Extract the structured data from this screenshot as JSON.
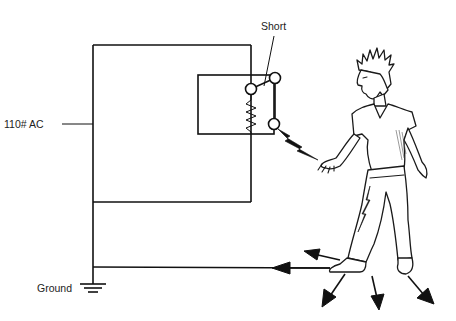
{
  "diagram": {
    "labels": {
      "source": "110# AC",
      "fault": "Short",
      "ground": "Ground"
    },
    "components": [
      {
        "id": "outer-circuit",
        "type": "loop"
      },
      {
        "id": "appliance-housing",
        "type": "box"
      },
      {
        "id": "heating-element",
        "type": "resistor"
      },
      {
        "id": "switch",
        "type": "switch",
        "state": "shorted to housing"
      },
      {
        "id": "ground-symbol",
        "type": "earth-ground"
      },
      {
        "id": "person",
        "type": "illustration",
        "pose": "touching housing"
      }
    ],
    "current_path": [
      "110# AC",
      "Short",
      "housing",
      "hand",
      "body",
      "feet",
      "Ground"
    ],
    "colors": {
      "line": "#111111",
      "background": "#ffffff",
      "text": "#222222"
    }
  }
}
